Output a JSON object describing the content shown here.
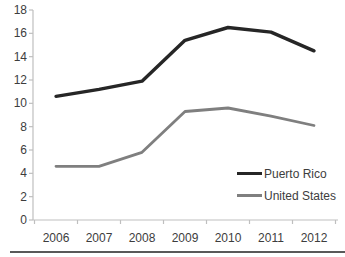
{
  "chart_data": {
    "type": "line",
    "title": "",
    "xlabel": "",
    "ylabel": "",
    "categories": [
      "2006",
      "2007",
      "2008",
      "2009",
      "2010",
      "2011",
      "2012"
    ],
    "series": [
      {
        "name": "Puerto Rico",
        "color": "#262626",
        "values": [
          10.6,
          11.2,
          11.9,
          15.4,
          16.5,
          16.1,
          14.5
        ]
      },
      {
        "name": "United States",
        "color": "#7f7f7f",
        "values": [
          4.6,
          4.6,
          5.8,
          9.3,
          9.6,
          8.9,
          8.1
        ]
      }
    ],
    "ylim": [
      0,
      18
    ],
    "y_ticks": [
      0,
      2,
      4,
      6,
      8,
      10,
      12,
      14,
      16,
      18
    ],
    "grid": "off",
    "legend_position": "right-center",
    "axis_color": "#bfbfbf",
    "label_color": "#3d3d3d",
    "divider_color": "#595959"
  }
}
